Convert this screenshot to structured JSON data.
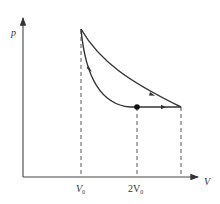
{
  "diagram": {
    "type": "p-V thermodynamic cycle",
    "axes": {
      "y_label": "p",
      "x_label": "V"
    },
    "tick_labels": {
      "v0": "V",
      "v0_sub": "0",
      "v2": "2V",
      "v2_sub": "0"
    },
    "points": [
      {
        "name": "top",
        "V": "V0",
        "p": "high"
      },
      {
        "name": "dot",
        "V": "2V0",
        "p": "low",
        "marked": true
      },
      {
        "name": "right",
        "V": "~2.8V0",
        "p": "low"
      }
    ],
    "processes": [
      {
        "from": "top",
        "to": "right",
        "shape": "upper curve",
        "direction": "arrow toward right"
      },
      {
        "from": "dot",
        "to": "right",
        "shape": "horizontal line",
        "direction": "arrow toward right"
      },
      {
        "from": "top",
        "to": "dot",
        "shape": "lower curve",
        "direction": "arrow downward"
      }
    ],
    "colors": {
      "line": "#333333",
      "background": "#ffffff"
    }
  }
}
